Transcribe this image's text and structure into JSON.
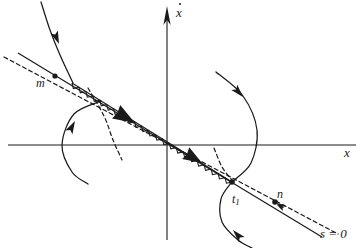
{
  "figure": {
    "background": "#ffffff",
    "ink": "#1a1a1a",
    "width": 362,
    "height": 248
  },
  "axes": {
    "vertical": {
      "label": "x",
      "label_accent": "dot",
      "label_full": "ẋ",
      "x": 167,
      "top_y": 8,
      "bottom_y": 240,
      "arrow": "up"
    },
    "horizontal": {
      "label": "x",
      "y": 145,
      "left_x": 8,
      "right_x": 356,
      "arrow": "none"
    },
    "origin": {
      "x": 167,
      "y": 145
    }
  },
  "labels": [
    {
      "name": "y-axis-label",
      "text": "x",
      "accent": "dot",
      "x": 176,
      "y": 6
    },
    {
      "name": "x-axis-label",
      "text": "x",
      "accent": "none",
      "x": 344,
      "y": 146
    },
    {
      "name": "point-label-m",
      "text": "m",
      "accent": "none",
      "x": 36,
      "y": 77
    },
    {
      "name": "point-label-n",
      "text": "n",
      "accent": "none",
      "x": 277,
      "y": 188
    },
    {
      "name": "time-label-t1",
      "text": "t",
      "sub": "1",
      "x": 232,
      "y": 193
    },
    {
      "name": "switching-surface-label",
      "text": "s = 0",
      "x": 320,
      "y": 227
    }
  ],
  "switching_line": {
    "name": "s=0",
    "type": "solid-straight",
    "from": {
      "x": 18,
      "y": 53
    },
    "to": {
      "x": 322,
      "y": 237
    },
    "passes_through_origin": true
  },
  "dashed_line": {
    "name": "estimated-switching-line",
    "type": "dashed-straight",
    "from": {
      "x": 4,
      "y": 57
    },
    "to": {
      "x": 338,
      "y": 234
    },
    "dash": "4 3"
  },
  "dashed_curve": {
    "name": "dashed-boundary-curve",
    "type": "dashed-curve",
    "points": [
      {
        "x": 88,
        "y": 88
      },
      {
        "x": 104,
        "y": 116
      },
      {
        "x": 113,
        "y": 140
      },
      {
        "x": 122,
        "y": 160
      }
    ]
  },
  "dashed_curve_right": {
    "name": "dashed-boundary-curve-right",
    "type": "dashed-curve",
    "points": [
      {
        "x": 214,
        "y": 148
      },
      {
        "x": 222,
        "y": 167
      },
      {
        "x": 232,
        "y": 180
      }
    ]
  },
  "sliding_segment": {
    "name": "sliding-mode-hatched-segment",
    "description": "zig-zag hatch marks along the switching line indicating the sliding region",
    "from": {
      "x": 72,
      "y": 83
    },
    "to": {
      "x": 232,
      "y": 182
    },
    "teeth": 46,
    "amplitude": 4
  },
  "sliding_arrows": [
    {
      "name": "sliding-direction-arrow-upper",
      "x": 135,
      "y": 123,
      "angle": 31,
      "size": 22
    },
    {
      "name": "sliding-direction-arrow-lower",
      "x": 202,
      "y": 163,
      "angle": 31,
      "size": 19
    }
  ],
  "trajectories": [
    {
      "name": "trajectory-upper-left",
      "points": [
        {
          "x": 41,
          "y": 2
        },
        {
          "x": 50,
          "y": 30
        },
        {
          "x": 60,
          "y": 55
        },
        {
          "x": 73,
          "y": 83
        }
      ],
      "arrow": {
        "x": 59,
        "y": 44,
        "angle": 68
      }
    },
    {
      "name": "trajectory-left-lower-loop",
      "points": [
        {
          "x": 101,
          "y": 101
        },
        {
          "x": 74,
          "y": 114
        },
        {
          "x": 62,
          "y": 145
        },
        {
          "x": 72,
          "y": 172
        },
        {
          "x": 88,
          "y": 184
        }
      ],
      "arrow": {
        "x": 75,
        "y": 121,
        "angle": -62
      }
    },
    {
      "name": "trajectory-right-upper",
      "points": [
        {
          "x": 216,
          "y": 72
        },
        {
          "x": 243,
          "y": 96
        },
        {
          "x": 257,
          "y": 130
        },
        {
          "x": 251,
          "y": 163
        },
        {
          "x": 233,
          "y": 181
        }
      ],
      "arrow": {
        "x": 243,
        "y": 97,
        "angle": 48
      }
    },
    {
      "name": "trajectory-right-lower",
      "points": [
        {
          "x": 231,
          "y": 183
        },
        {
          "x": 221,
          "y": 199
        },
        {
          "x": 222,
          "y": 222
        },
        {
          "x": 238,
          "y": 240
        },
        {
          "x": 252,
          "y": 248
        }
      ],
      "arrow": {
        "x": 233,
        "y": 230,
        "angle": -132
      }
    }
  ],
  "markers": [
    {
      "name": "marker-point-m",
      "x": 55,
      "y": 76,
      "r": 2.6
    },
    {
      "name": "marker-point-n",
      "x": 275,
      "y": 202,
      "r": 2.8
    },
    {
      "name": "marker-point-t1",
      "x": 232,
      "y": 182,
      "r": 2.8
    }
  ],
  "small_arrows": [
    {
      "name": "arrow-toward-n",
      "x": 276,
      "y": 203,
      "angle": 210,
      "size": 9
    },
    {
      "name": "arrow-along-n-line",
      "x": 277,
      "y": 205,
      "angle": 209,
      "size": 8
    }
  ]
}
